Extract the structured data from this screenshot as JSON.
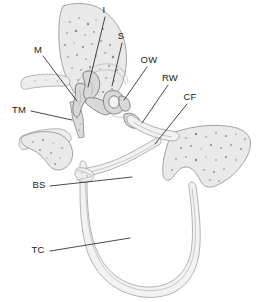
{
  "figure": {
    "background_color": "#ffffff",
    "line_color": "#1a1a1a",
    "bone_fill_color": "#e9e9e9",
    "bone_outline_color": "#8e8e8e",
    "ossicle_fill_color": "#d8d8d8",
    "stipple_color": "#a9a9a9",
    "width": 257,
    "height": 302
  },
  "labels": [
    {
      "id": "I",
      "text": "I",
      "x": 104,
      "y": 13,
      "anchor": "middle",
      "leader": "M 105 17 L 88 87"
    },
    {
      "id": "S",
      "text": "S",
      "x": 121,
      "y": 39,
      "anchor": "middle",
      "leader": "M 122 43 L 112 86"
    },
    {
      "id": "M",
      "text": "M",
      "x": 38,
      "y": 53,
      "anchor": "middle",
      "leader": "M 43 56 L 77 101"
    },
    {
      "id": "OW",
      "text": "OW",
      "x": 149,
      "y": 63,
      "anchor": "middle",
      "leader": "M 147 67 L 124 100"
    },
    {
      "id": "RW",
      "text": "RW",
      "x": 170,
      "y": 81,
      "anchor": "middle",
      "leader": "M 168 85 L 142 123"
    },
    {
      "id": "CF",
      "text": "CF",
      "x": 190,
      "y": 100,
      "anchor": "middle",
      "leader": "M 187 104 L 155 144"
    },
    {
      "id": "TM",
      "text": "TM",
      "x": 19,
      "y": 113,
      "anchor": "middle",
      "leader": "M 31 111 L 72 120"
    },
    {
      "id": "BS",
      "text": "BS",
      "x": 39,
      "y": 188,
      "anchor": "middle",
      "leader": "M 50 186 L 132 177"
    },
    {
      "id": "TC",
      "text": "TC",
      "x": 38,
      "y": 253,
      "anchor": "middle",
      "leader": "M 50 251 L 130 238"
    }
  ],
  "structures": [
    {
      "id": "upper-bone-mass",
      "name": "temporal-bone-upper"
    },
    {
      "id": "right-bone-mass",
      "name": "temporal-bone-right"
    },
    {
      "id": "ear-canal-upper",
      "name": "external-auditory-canal-upper-wall"
    },
    {
      "id": "ear-canal-lower",
      "name": "external-auditory-canal-lower-wall"
    },
    {
      "id": "tympanic-membrane",
      "name": "tympanic-membrane"
    },
    {
      "id": "malleus",
      "name": "malleus-ossicle"
    },
    {
      "id": "incus",
      "name": "incus-ossicle"
    },
    {
      "id": "stapes",
      "name": "stapes-ossicle"
    },
    {
      "id": "oval-window",
      "name": "oval-window"
    },
    {
      "id": "round-window",
      "name": "round-window"
    },
    {
      "id": "cochlear-tube",
      "name": "cochlear-tube-loop"
    },
    {
      "id": "bony-septum",
      "name": "bony-septum"
    }
  ]
}
